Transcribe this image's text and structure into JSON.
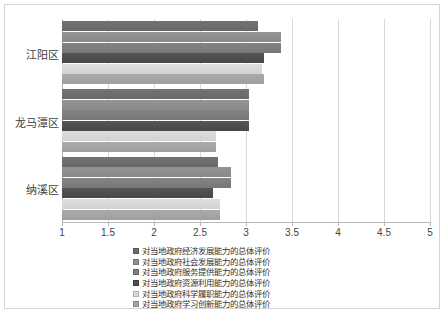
{
  "chart_data": {
    "type": "bar",
    "orientation": "horizontal",
    "title": "",
    "xlabel": "",
    "ylabel": "",
    "xlim": [
      1,
      5
    ],
    "xticks": [
      "1",
      "1.5",
      "2",
      "2.5",
      "3",
      "3.5",
      "4",
      "4.5",
      "5"
    ],
    "xtick_values": [
      1,
      1.5,
      2,
      2.5,
      3,
      3.5,
      4,
      4.5,
      5
    ],
    "grid": true,
    "legend_position": "bottom",
    "categories": [
      "江阳区",
      "龙马潭区",
      "纳溪区"
    ],
    "series": [
      {
        "name": "对当地政府经济发展能力的总体评价",
        "color": "#6b6b6b",
        "values": [
          3.13,
          3.03,
          2.7
        ]
      },
      {
        "name": "对当地政府社会发展能力的总体评价",
        "color": "#8f8f8f",
        "values": [
          3.38,
          3.03,
          2.84
        ]
      },
      {
        "name": "对当地政府服务提供能力的总体评价",
        "color": "#7d7d7d",
        "values": [
          3.38,
          3.03,
          2.84
        ]
      },
      {
        "name": "对当地政府资源利用能力的总体评价",
        "color": "#4e4e4e",
        "values": [
          3.2,
          3.03,
          2.64
        ]
      },
      {
        "name": "对当地政府科学履职能力的总体评价",
        "color": "#d8d8d8",
        "values": [
          3.17,
          2.67,
          2.72
        ]
      },
      {
        "name": "对当地政府学习创新能力的总体评价",
        "color": "#a4a4a4",
        "values": [
          3.2,
          2.67,
          2.72
        ]
      }
    ]
  }
}
